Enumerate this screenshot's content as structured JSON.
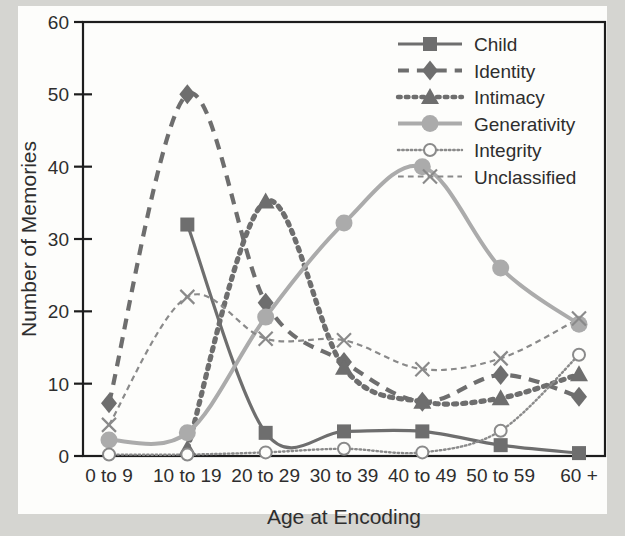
{
  "chart_data": {
    "type": "line",
    "title": "",
    "xlabel": "Age at Encoding",
    "ylabel": "Number of Memories",
    "categories": [
      "0 to 9",
      "10 to 19",
      "20 to 29",
      "30 to 39",
      "40 to 49",
      "50 to 59",
      "60 +"
    ],
    "ylim": [
      0,
      60
    ],
    "yticks": [
      0,
      10,
      20,
      30,
      40,
      50,
      60
    ],
    "grid": false,
    "legend_position": "top-right",
    "series": [
      {
        "name": "Child",
        "marker": "filled-square",
        "line_style": "solid",
        "color": "#6e6e6e",
        "values": [
          null,
          32,
          3.2,
          3.4,
          3.4,
          1.5,
          0.4
        ]
      },
      {
        "name": "Identity",
        "marker": "filled-diamond",
        "line_style": "dashed",
        "color": "#6e6e6e",
        "values": [
          7.3,
          50,
          21.2,
          13,
          7.5,
          11.2,
          8.2
        ]
      },
      {
        "name": "Intimacy",
        "marker": "filled-triangle",
        "line_style": "dotted",
        "color": "#6e6e6e",
        "values": [
          null,
          1,
          35.2,
          12.2,
          7.5,
          8,
          11.3
        ]
      },
      {
        "name": "Generativity",
        "marker": "filled-circle",
        "line_style": "solid",
        "color": "#ababab",
        "values": [
          2.2,
          3.2,
          19.2,
          32.2,
          40,
          26,
          18.2
        ]
      },
      {
        "name": "Integrity",
        "marker": "open-circle",
        "line_style": "dotted",
        "color": "#8a8a8a",
        "values": [
          0.2,
          0.2,
          0.5,
          1,
          0.5,
          3.5,
          14
        ]
      },
      {
        "name": "Unclassified",
        "marker": "cross",
        "line_style": "dashed",
        "color": "#8a8a8a",
        "values": [
          4.3,
          22,
          16.2,
          16,
          12,
          13.5,
          19
        ]
      }
    ]
  },
  "legend": {
    "entries": [
      {
        "label": "Child"
      },
      {
        "label": "Identity"
      },
      {
        "label": "Intimacy"
      },
      {
        "label": "Generativity"
      },
      {
        "label": "Integrity"
      },
      {
        "label": "Unclassified"
      }
    ]
  },
  "colors": {
    "axis": "#1d1d1d",
    "text": "#2e2e2e",
    "dark_series": "#6e6e6e",
    "light_series": "#ababab",
    "mid_series": "#8a8a8a",
    "paper": "#fdfdfb",
    "backdrop": "#d5d5d1"
  }
}
